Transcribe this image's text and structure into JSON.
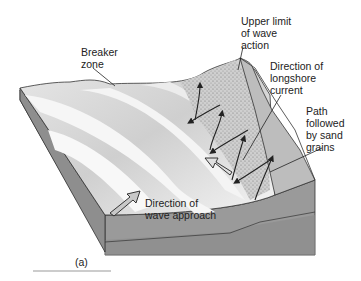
{
  "figure": {
    "panel_label": "(a)",
    "labels": {
      "breaker_zone": "Breaker\nzone",
      "upper_limit": "Upper limit\nof wave\naction",
      "longshore_current": "Direction of\nlongshore\ncurrent",
      "sand_path": "Path\nfollowed\nby sand\ngrains",
      "wave_approach": "Direction of\nwave approach"
    },
    "colors": {
      "block_side": "#8c8c8c",
      "block_front": "#9a9a9a",
      "block_bottom": "#b0b0b0",
      "wave_crest": "#f2f2f2",
      "wave_trough": "#c4c4c4",
      "beach": "#d6d6d6",
      "backshore": "#b8b8b8",
      "outline": "#333333"
    }
  }
}
